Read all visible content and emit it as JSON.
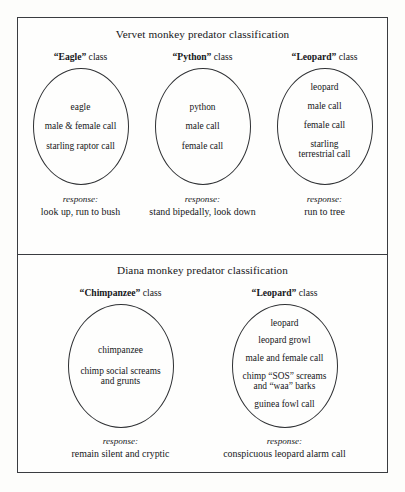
{
  "figure": {
    "panels": [
      {
        "id": "vervet",
        "title": "Vervet monkey predator classification",
        "columns": [
          {
            "class_term": "“Eagle”",
            "class_suffix": " class",
            "bubble_align": "center",
            "items": [
              "eagle",
              "male & female call",
              "starling raptor call"
            ],
            "response_label": "response:",
            "response_text": "look up, run to bush"
          },
          {
            "class_term": "“Python”",
            "class_suffix": " class",
            "bubble_align": "center",
            "items": [
              "python",
              "male call",
              "female call"
            ],
            "response_label": "response:",
            "response_text": "stand bipedally, look down"
          },
          {
            "class_term": "“Leopard”",
            "class_suffix": " class",
            "bubble_align": "top",
            "items": [
              "leopard",
              "male call",
              "female call",
              "starling|terrestrial call"
            ],
            "response_label": "response:",
            "response_text": "run to tree"
          }
        ]
      },
      {
        "id": "diana",
        "title": "Diana monkey predator classification",
        "columns": [
          {
            "class_term": "“Chimpanzee”",
            "class_suffix": " class",
            "bubble_align": "center",
            "items": [
              "chimpanzee",
              "chimp social screams|and grunts"
            ],
            "response_label": "response:",
            "response_text": "remain silent and cryptic"
          },
          {
            "class_term": "“Leopard”",
            "class_suffix": " class",
            "bubble_align": "top",
            "items": [
              "leopard",
              "leopard growl",
              "male and female call",
              "chimp “SOS” screams|and “waa” barks",
              "guinea fowl call"
            ],
            "response_label": "response:",
            "response_text": "conspicuous leopard alarm call"
          }
        ]
      }
    ]
  }
}
